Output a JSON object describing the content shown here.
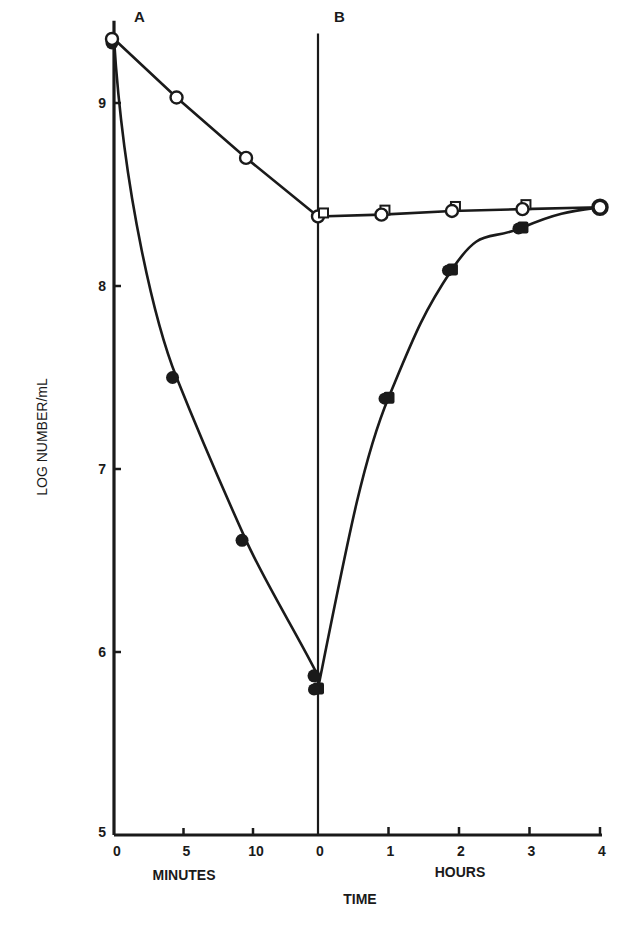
{
  "chart_data": {
    "type": "line",
    "title": "",
    "panels": [
      {
        "label": "A",
        "xlabel": "MINUTES",
        "x_ticks": [
          "0",
          "5",
          "10"
        ],
        "xlim": [
          0,
          14.5
        ]
      },
      {
        "label": "B",
        "xlabel": "HOURS",
        "x_ticks": [
          "0",
          "1",
          "2",
          "3",
          "4"
        ],
        "xlim": [
          0,
          4
        ]
      }
    ],
    "xlabel": "TIME",
    "ylabel": "LOG NUMBER/mL",
    "y_ticks": [
      "5",
      "6",
      "7",
      "8",
      "9"
    ],
    "ylim": [
      5,
      9.45
    ],
    "series": [
      {
        "name": "open circles",
        "marker": "open-circle",
        "panel_A": {
          "x": [
            0,
            4.5,
            9.5,
            14.5
          ],
          "y": [
            9.35,
            9.03,
            8.7,
            8.38
          ]
        },
        "panel_B": {
          "x": [
            0,
            0.9,
            1.9,
            2.9,
            4.0
          ],
          "y": [
            8.38,
            8.39,
            8.41,
            8.42,
            8.43
          ]
        }
      },
      {
        "name": "filled circles",
        "marker": "filled-circle",
        "panel_A": {
          "x": [
            0,
            4.5,
            9.5,
            14.5
          ],
          "y": [
            9.35,
            7.5,
            6.61,
            5.87
          ]
        },
        "panel_B": {
          "x": [
            0,
            1.0,
            1.9,
            2.9,
            4.0
          ],
          "y": [
            5.8,
            7.39,
            8.09,
            8.32,
            8.43
          ]
        }
      }
    ]
  }
}
